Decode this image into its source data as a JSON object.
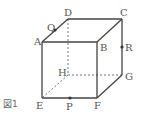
{
  "figure": {
    "caption": "図1",
    "shape": "cube",
    "vertices": {
      "A": "A",
      "B": "B",
      "C": "C",
      "D": "D",
      "E": "E",
      "F": "F",
      "G": "G",
      "H": "H"
    },
    "points": {
      "P": {
        "label": "P",
        "on_edge": "EF"
      },
      "Q": {
        "label": "Q",
        "on_edge": "AD"
      },
      "R": {
        "label": "R",
        "on_edge": "CG"
      }
    },
    "visible_edges": [
      "AB",
      "BC",
      "CD",
      "DA",
      "AE",
      "BF",
      "CG",
      "EF",
      "FG"
    ],
    "hidden_edges": [
      "DH",
      "EH",
      "GH"
    ],
    "colors": {
      "edge": "#444444",
      "hidden_edge": "#777777",
      "label": "#555555"
    }
  }
}
